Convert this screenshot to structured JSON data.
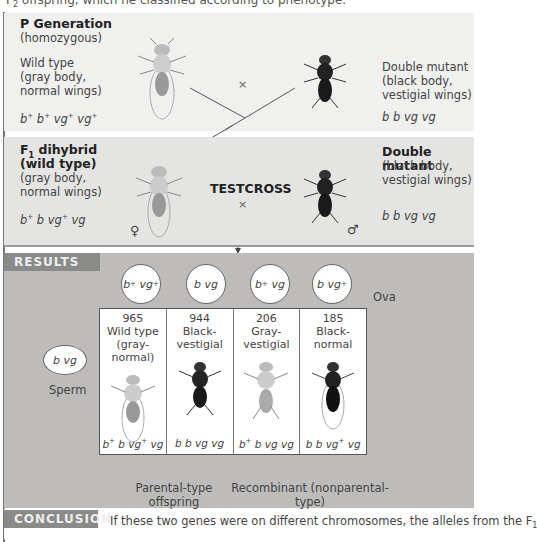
{
  "top_text": "F2 offspring, which he classified according to phenotype.",
  "p_generation": {
    "title": "P Generation",
    "subtitle": "(homozygous)",
    "left": {
      "phenotype": [
        "Wild type",
        "(gray body,",
        "normal wings)"
      ],
      "genotype": "b+ b+ vg+ vg+"
    },
    "cross_symbol": "×",
    "right": {
      "phenotype": [
        "Double mutant",
        "(black body,",
        "vestigial wings)"
      ],
      "genotype": "b b vg vg"
    }
  },
  "f1": {
    "title_line1": "F1 dihybrid",
    "title_line2": "(wild type)",
    "left": {
      "phenotype": [
        "(gray body,",
        "normal wings)"
      ],
      "genotype": "b+ b vg+ vg",
      "sex": "♀"
    },
    "center_label": "TESTCROSS",
    "cross_symbol": "×",
    "right": {
      "title": "Double mutant",
      "phenotype": [
        "(black body,",
        "vestigial wings)"
      ],
      "genotype": "b b vg vg",
      "sex": "♂"
    }
  },
  "results": {
    "tag": "RESULTS",
    "ova_label": "Ova",
    "sperm_label": "Sperm",
    "sperm_genotype": "b vg",
    "ova": [
      "b+ vg+",
      "b vg",
      "b+ vg",
      "b vg+"
    ],
    "offspring": [
      {
        "count": "965",
        "phenotype": [
          "Wild type",
          "(gray-normal)"
        ],
        "genotype": "b+ b vg+ vg",
        "color": "light"
      },
      {
        "count": "944",
        "phenotype": [
          "Black-",
          "vestigial"
        ],
        "genotype": "b b vg vg",
        "color": "dark"
      },
      {
        "count": "206",
        "phenotype": [
          "Gray-",
          "vestigial"
        ],
        "genotype": "b+ b vg vg",
        "color": "light"
      },
      {
        "count": "185",
        "phenotype": [
          "Black-",
          "normal"
        ],
        "genotype": "b b vg+ vg",
        "color": "dark"
      }
    ],
    "parental_label": [
      "Parental-type",
      "offspring"
    ],
    "recombinant_label": [
      "Recombinant (nonparental-type)",
      "offspring"
    ]
  },
  "conclusion": {
    "tag": "CONCLUSION",
    "text": "If these two genes were on different chromosomes, the alleles from the F1"
  }
}
